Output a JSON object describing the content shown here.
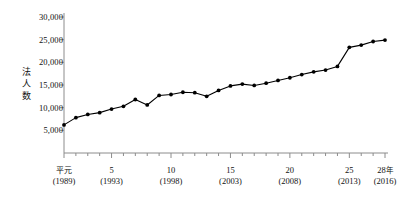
{
  "chart_data": {
    "type": "line",
    "title": "",
    "xlabel": "",
    "ylabel": "法人数",
    "ylim": [
      0,
      30000
    ],
    "ytick_values": [
      5000,
      10000,
      15000,
      20000,
      25000,
      30000
    ],
    "ytick_labels": [
      "5,000",
      "10,000",
      "15,000",
      "20,000",
      "25,000",
      "30,000"
    ],
    "grid": false,
    "legend": "none",
    "x": [
      1989,
      1990,
      1991,
      1992,
      1993,
      1994,
      1995,
      1996,
      1997,
      1998,
      1999,
      2000,
      2001,
      2002,
      2003,
      2004,
      2005,
      2006,
      2007,
      2008,
      2009,
      2010,
      2011,
      2012,
      2013,
      2014,
      2015,
      2016
    ],
    "xtick_era_labels": [
      {
        "era": "平元",
        "year": "(1989)",
        "value": 1989
      },
      {
        "era": "5",
        "year": "(1993)",
        "value": 1993
      },
      {
        "era": "10",
        "year": "(1998)",
        "value": 1998
      },
      {
        "era": "15",
        "year": "(2003)",
        "value": 2003
      },
      {
        "era": "20",
        "year": "(2008)",
        "value": 2008
      },
      {
        "era": "25",
        "year": "(2013)",
        "value": 2013
      },
      {
        "era": "28",
        "era_unit": "年",
        "year": "(2016)",
        "value": 2016
      }
    ],
    "series": [
      {
        "name": "法人数",
        "color": "#000000",
        "marker": "circle",
        "values": [
          6200,
          7800,
          8500,
          8900,
          9700,
          10300,
          11800,
          10600,
          12700,
          12900,
          13400,
          13300,
          12500,
          13800,
          14800,
          15200,
          14900,
          15400,
          16000,
          16600,
          17300,
          17900,
          18300,
          19100,
          23300,
          23800,
          24600,
          24900
        ]
      }
    ]
  },
  "axis_style": {
    "axis_color": "#8c8c8c",
    "line_color": "#000000",
    "marker_color": "#000000",
    "background": "#ffffff"
  },
  "footnote": {
    "text": ""
  }
}
